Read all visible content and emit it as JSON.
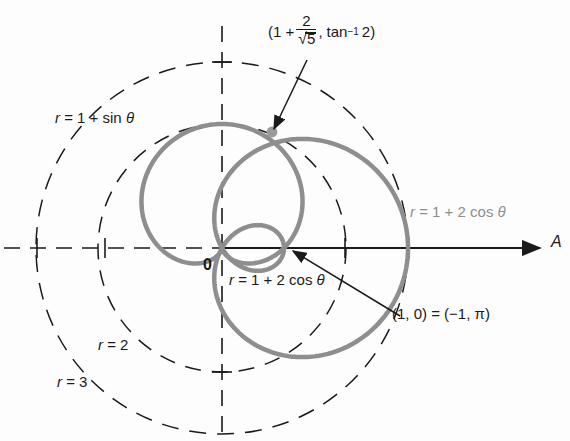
{
  "figure": {
    "title_text": "",
    "colors": {
      "curve": "#8e8e8e",
      "axis": "#1a1a1a",
      "grid_dashed": "#1a1a1a",
      "text": "#1a1a1a",
      "text_gray": "#8e8e8e"
    },
    "origin_label": "0",
    "axis_label": "A"
  },
  "labels": {
    "cardioid": {
      "r_sym": "r",
      "eq": "= 1 + sin",
      "theta": "θ"
    },
    "limacon_right": {
      "r_sym": "r",
      "eq": "= 1 + 2 cos",
      "theta": "θ"
    },
    "limacon_inner": {
      "r_sym": "r",
      "eq": "= 1 + 2 cos",
      "theta": "θ"
    },
    "circle_r2": {
      "r_sym": "r",
      "eq": "= 2"
    },
    "circle_r3": {
      "r_sym": "r",
      "eq": "= 3"
    },
    "point_1_0": "(1, 0) = (−1, π)",
    "intersection": {
      "open": "(1 +",
      "numerator": "2",
      "radical_symbol": "√",
      "denominator": "5",
      "comma": ",",
      "tan": "tan",
      "exponent": "−1",
      "arg": "2",
      "close": ")"
    }
  },
  "chart_data": {
    "type": "line",
    "title": "",
    "xlabel": "A",
    "ylabel": "",
    "coordinate_system": "polar",
    "origin_label": "0",
    "grid": true,
    "grid_circles": [
      {
        "label": "r = 2",
        "r": 2
      },
      {
        "label": "r = 3",
        "r": 3
      }
    ],
    "axis_ticks_r": [
      1,
      2,
      3
    ],
    "xlim": [
      -3.5,
      5.4
    ],
    "ylim": [
      -3.1,
      3.6
    ],
    "series": [
      {
        "name": "r = 1 + sin θ",
        "equation": "r = 1 + sin(theta)",
        "curve_type": "cardioid",
        "color": "#8e8e8e",
        "max_r": 2,
        "min_r": 0
      },
      {
        "name": "r = 1 + 2 cos θ",
        "equation": "r = 1 + 2*cos(theta)",
        "curve_type": "limacon-with-inner-loop",
        "color": "#8e8e8e",
        "max_r": 3,
        "min_r": -1,
        "inner_loop": true
      }
    ],
    "annotations": [
      {
        "text": "(1 + 2/√5 , tan⁻¹ 2)",
        "kind": "intersection-point",
        "r": 1.894,
        "theta_deg": 63.435,
        "marker": "dot"
      },
      {
        "text": "(1, 0) = (−1, π)",
        "kind": "point",
        "r": 1,
        "theta_deg": 0
      }
    ]
  }
}
